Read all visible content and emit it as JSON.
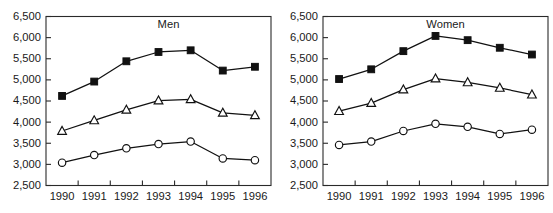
{
  "chart_data": [
    {
      "type": "line",
      "title": "Men",
      "xlabel": "",
      "ylabel": "",
      "x": [
        1990,
        1991,
        1992,
        1993,
        1994,
        1995,
        1996
      ],
      "categories": [
        "1990",
        "1991",
        "1992",
        "1993",
        "1994",
        "1995",
        "1996"
      ],
      "ylim": [
        2500,
        6500
      ],
      "yticks": [
        2500,
        3000,
        3500,
        4000,
        4500,
        5000,
        5500,
        6000,
        6500
      ],
      "ytick_labels": [
        "2,500",
        "3,000",
        "3,500",
        "4,000",
        "4,500",
        "5,000",
        "5,500",
        "6,000",
        "6,500"
      ],
      "grid": false,
      "legend": "none",
      "series": [
        {
          "name": "filled-square-series",
          "marker": "square",
          "values": [
            4620,
            4960,
            5440,
            5660,
            5700,
            5220,
            5310
          ]
        },
        {
          "name": "open-triangle-series",
          "marker": "triangle",
          "values": [
            3790,
            4040,
            4290,
            4510,
            4540,
            4220,
            4160
          ]
        },
        {
          "name": "open-circle-series",
          "marker": "circle",
          "values": [
            3040,
            3220,
            3380,
            3480,
            3540,
            3140,
            3100
          ]
        }
      ]
    },
    {
      "type": "line",
      "title": "Women",
      "xlabel": "",
      "ylabel": "",
      "x": [
        1990,
        1991,
        1992,
        1993,
        1994,
        1995,
        1996
      ],
      "categories": [
        "1990",
        "1991",
        "1992",
        "1993",
        "1994",
        "1995",
        "1996"
      ],
      "ylim": [
        2500,
        6500
      ],
      "yticks": [
        2500,
        3000,
        3500,
        4000,
        4500,
        5000,
        5500,
        6000,
        6500
      ],
      "ytick_labels": [
        "2,500",
        "3,000",
        "3,500",
        "4,000",
        "4,500",
        "5,000",
        "5,500",
        "6,000",
        "6,500"
      ],
      "grid": false,
      "legend": "none",
      "series": [
        {
          "name": "filled-square-series",
          "marker": "square",
          "values": [
            5020,
            5250,
            5680,
            6040,
            5940,
            5760,
            5600
          ]
        },
        {
          "name": "open-triangle-series",
          "marker": "triangle",
          "values": [
            4260,
            4450,
            4770,
            5030,
            4940,
            4810,
            4650
          ]
        },
        {
          "name": "open-circle-series",
          "marker": "circle",
          "values": [
            3460,
            3540,
            3790,
            3960,
            3890,
            3720,
            3820
          ]
        }
      ]
    }
  ],
  "colors": {
    "line": "#111111",
    "marker_fill_solid": "#111111",
    "marker_fill_open": "#ffffff",
    "axis": "#2a2a2a",
    "text": "#1a1a1a",
    "background": "#ffffff"
  }
}
